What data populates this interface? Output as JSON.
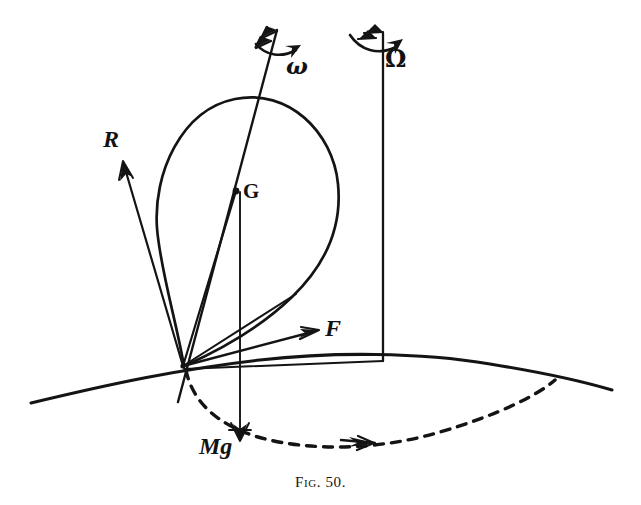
{
  "figure": {
    "caption_prefix": "Fig.",
    "caption_number": "50.",
    "caption_full": "Fig. 50.",
    "alt": "Diagram of a spinning top precessing: teardrop-shaped body with spin axis omega, vertical precession axis Omega, reaction R, weight Mg and force F at the pivot on a curved ground with a dashed precession circle."
  },
  "labels": {
    "spin_axis": "ω",
    "precession_axis": "Ω",
    "reaction": "R",
    "centre_of_mass": "G",
    "force": "F",
    "weight": "Mg"
  },
  "elements": {
    "body": "teardrop-top-body",
    "ground": "ground-curve",
    "precession_circle": "dashed-precession-circle",
    "pivot": "pivot-point"
  },
  "colors": {
    "ink": "#141414",
    "paper": "#ffffff"
  },
  "geometry": {
    "pivot": {
      "x": 183,
      "y": 366
    },
    "centre_of_mass": {
      "x": 235,
      "y": 192
    },
    "spin_axis_top": {
      "x": 277,
      "y": 28
    },
    "spin_axis_bottom": {
      "x": 178,
      "y": 402
    },
    "precession_axis_top": {
      "x": 383,
      "y": 30
    },
    "precession_axis_bottom": {
      "x": 383,
      "y": 361
    },
    "weight_arrow_tip": {
      "x": 241,
      "y": 440
    },
    "force_arrow_tip": {
      "x": 317,
      "y": 330
    },
    "reaction_arrow_tip": {
      "x": 122,
      "y": 162
    }
  }
}
